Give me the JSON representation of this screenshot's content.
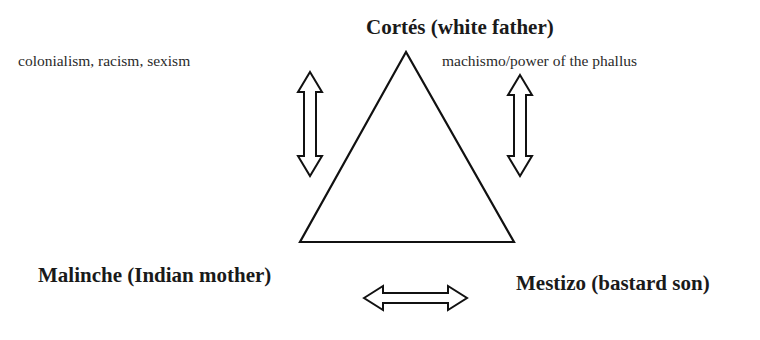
{
  "diagram": {
    "nodes": {
      "top": "Cortés (white father)",
      "bottom_left": "Malinche (Indian mother)",
      "bottom_right": "Mestizo (bastard son)"
    },
    "edge_labels": {
      "left": "colonialism, racism, sexism",
      "right": "machismo/power of the phallus"
    },
    "arrows": [
      {
        "name": "left-vertical",
        "type": "double-headed",
        "orientation": "vertical"
      },
      {
        "name": "right-vertical",
        "type": "double-headed",
        "orientation": "vertical"
      },
      {
        "name": "bottom-horizontal",
        "type": "double-headed",
        "orientation": "horizontal"
      }
    ],
    "shape": "triangle",
    "stroke_color": "#111111"
  }
}
